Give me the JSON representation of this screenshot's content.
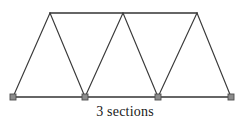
{
  "figure": {
    "type": "warren-truss-diagram",
    "caption": "3 sections",
    "section_count": 3,
    "colors": {
      "line": "#3a3a3a",
      "chord": "#333333",
      "support_fill": "#8c8c8c",
      "support_stroke": "#4d4d4d",
      "background": "#ffffff",
      "caption_text": "#1a1a1a"
    },
    "geometry": {
      "top_chord": {
        "x1": 50,
        "y1": 13,
        "x2": 197,
        "y2": 13
      },
      "bottom_chord": {
        "x1": 13,
        "y1": 97,
        "x2": 231,
        "y2": 97
      },
      "top_nodes": [
        {
          "id": "T1",
          "x": 50,
          "y": 13
        },
        {
          "id": "T2",
          "x": 123,
          "y": 13
        },
        {
          "id": "T3",
          "x": 197,
          "y": 13
        }
      ],
      "bottom_nodes": [
        {
          "id": "B1",
          "x": 13,
          "y": 97
        },
        {
          "id": "B2",
          "x": 85,
          "y": 97
        },
        {
          "id": "B3",
          "x": 158,
          "y": 97
        },
        {
          "id": "B4",
          "x": 231,
          "y": 97
        }
      ],
      "diagonals": [
        {
          "id": "D1",
          "from": "B1",
          "to": "T1",
          "x1": 13,
          "y1": 97,
          "x2": 50,
          "y2": 13
        },
        {
          "id": "D2",
          "from": "T1",
          "to": "B2",
          "x1": 50,
          "y1": 13,
          "x2": 85,
          "y2": 97
        },
        {
          "id": "D3",
          "from": "B2",
          "to": "T2",
          "x1": 85,
          "y1": 97,
          "x2": 123,
          "y2": 13
        },
        {
          "id": "D4",
          "from": "T2",
          "to": "B3",
          "x1": 123,
          "y1": 13,
          "x2": 158,
          "y2": 97
        },
        {
          "id": "D5",
          "from": "B3",
          "to": "T3",
          "x1": 158,
          "y1": 97,
          "x2": 197,
          "y2": 13
        },
        {
          "id": "D6",
          "from": "T3",
          "to": "B4",
          "x1": 197,
          "y1": 13,
          "x2": 231,
          "y2": 97
        }
      ],
      "supports": [
        {
          "id": "S1",
          "x": 13,
          "y": 97,
          "size": 6
        },
        {
          "id": "S2",
          "x": 85,
          "y": 97,
          "size": 6
        },
        {
          "id": "S3",
          "x": 158,
          "y": 97,
          "size": 6
        },
        {
          "id": "S4",
          "x": 231,
          "y": 97,
          "size": 6
        }
      ]
    }
  }
}
